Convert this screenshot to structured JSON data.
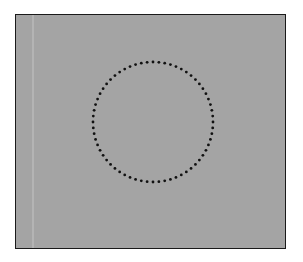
{
  "figure": {
    "background_color": "#a4a4a4",
    "border_color": "#1a1a1a",
    "circle": {
      "shape": "circle",
      "style": "dotted",
      "color": "#111111",
      "center_x": 153,
      "center_y": 122,
      "radius": 60,
      "dot_count": 64
    }
  }
}
